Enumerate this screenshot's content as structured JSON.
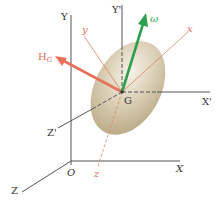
{
  "diagram": {
    "type": "rigid-body-angular-momentum",
    "fixed_frame": {
      "origin": "O",
      "axes": [
        "X",
        "Y",
        "Z"
      ]
    },
    "translating_frame": {
      "origin": "G",
      "axes": [
        "X'",
        "Y'",
        "Z'"
      ]
    },
    "body_axes": [
      "x",
      "y",
      "z"
    ],
    "vectors": {
      "angular_velocity": {
        "label": "ω",
        "color": "#2e9e4f"
      },
      "angular_momentum": {
        "label": "H",
        "subscript": "G",
        "color": "#e8705a"
      }
    },
    "body": {
      "shape": "ellipsoid",
      "color": "#cfc3a6"
    },
    "colors": {
      "axis": "#555555",
      "body_axis": "#d8835f",
      "body_axis_label": "#e07060"
    }
  },
  "labels": {
    "O": "O",
    "X": "X",
    "Y": "Y",
    "Z": "Z",
    "G": "G",
    "Xp": "X'",
    "Yp": "Y'",
    "Zp": "Z'",
    "x": "x",
    "y": "y",
    "z": "z",
    "omega": "ω",
    "H": "H",
    "H_sub": "G"
  }
}
